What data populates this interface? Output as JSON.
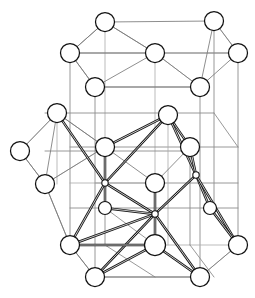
{
  "figure": {
    "width": 255,
    "height": 298,
    "background_color": "#ffffff"
  },
  "colors": {
    "cell_edge": "#8d8d8d",
    "cell_edge_faint": "#a9a9a9",
    "bond_thin": "#7a7a7a",
    "bond_strong": "#141414",
    "atom_fill": "#ffffff",
    "atom_stroke": "#111111"
  },
  "chart_data": {
    "type": "scatter",
    "xlabel": "",
    "ylabel": "",
    "xlim": [
      0,
      255
    ],
    "ylim": [
      0,
      298
    ],
    "grid": false,
    "legend": null,
    "atoms_large": [
      {
        "id": "A1",
        "label": "top-apex-atom",
        "x": 105,
        "y": 22,
        "r": 9.5
      },
      {
        "id": "A2",
        "label": "top-right-atom",
        "x": 214,
        "y": 21,
        "r": 9.5
      },
      {
        "id": "A3",
        "label": "upper-left-atom",
        "x": 70,
        "y": 53,
        "r": 9.5
      },
      {
        "id": "A4",
        "label": "upper-center-atom",
        "x": 155,
        "y": 53,
        "r": 9.5
      },
      {
        "id": "A5",
        "label": "upper-right-edge-atom",
        "x": 238,
        "y": 53,
        "r": 9.5
      },
      {
        "id": "A6",
        "label": "upper-inner-left-atom",
        "x": 95,
        "y": 87,
        "r": 9.5
      },
      {
        "id": "A7",
        "label": "upper-inner-right-atom",
        "x": 200,
        "y": 87,
        "r": 9.5
      },
      {
        "id": "A8",
        "label": "mid-left-corner-atom",
        "x": 57,
        "y": 113,
        "r": 9.5
      },
      {
        "id": "A9",
        "label": "mid-center-top-atom",
        "x": 168,
        "y": 115,
        "r": 9.5
      },
      {
        "id": "A10",
        "label": "far-left-atom",
        "x": 20,
        "y": 151,
        "r": 9.5
      },
      {
        "id": "A11",
        "label": "mid-left-inner-atom",
        "x": 105,
        "y": 147,
        "r": 9.5
      },
      {
        "id": "A12",
        "label": "mid-right-inner-atom",
        "x": 190,
        "y": 147,
        "r": 9.5
      },
      {
        "id": "A13",
        "label": "lower-left-outer-atom",
        "x": 45,
        "y": 184,
        "r": 9.5
      },
      {
        "id": "A14",
        "label": "center-atom",
        "x": 155,
        "y": 183,
        "r": 9.5
      },
      {
        "id": "A15",
        "label": "bottom-left-corner-atom",
        "x": 70,
        "y": 245,
        "r": 9.5
      },
      {
        "id": "A16",
        "label": "bottom-center-atom",
        "x": 155,
        "y": 245,
        "r": 10.5
      },
      {
        "id": "A17",
        "label": "bottom-right-corner-atom",
        "x": 238,
        "y": 245,
        "r": 9.5
      },
      {
        "id": "A18",
        "label": "bottom-front-left-atom",
        "x": 95,
        "y": 277,
        "r": 9.5
      },
      {
        "id": "A19",
        "label": "bottom-front-right-atom",
        "x": 200,
        "y": 277,
        "r": 9.5
      }
    ],
    "atoms_small": [
      {
        "id": "S1",
        "label": "small-atom-left-lower",
        "x": 105,
        "y": 208,
        "r": 6.5
      },
      {
        "id": "S2",
        "label": "small-atom-right-lower",
        "x": 210,
        "y": 208,
        "r": 6.5
      }
    ],
    "nodes_center": [
      {
        "id": "N1",
        "label": "tetrahedral-center-left",
        "x": 105,
        "y": 183,
        "r": 3.2
      },
      {
        "id": "N2",
        "label": "tetrahedral-center-right",
        "x": 196,
        "y": 175,
        "r": 3.2
      },
      {
        "id": "N3",
        "label": "tetrahedral-center-bottom",
        "x": 155,
        "y": 214,
        "r": 3.2
      }
    ],
    "strong_bonds": [
      {
        "from": "A8",
        "to": "N1"
      },
      {
        "from": "A11",
        "to": "N1"
      },
      {
        "from": "N1",
        "to": "S1"
      },
      {
        "from": "N1",
        "to": "A15"
      },
      {
        "from": "N1",
        "to": "N3"
      },
      {
        "from": "A9",
        "to": "N1"
      },
      {
        "from": "A9",
        "to": "A11"
      },
      {
        "from": "A9",
        "to": "A12"
      },
      {
        "from": "A9",
        "to": "N2"
      },
      {
        "from": "A12",
        "to": "N2"
      },
      {
        "from": "N2",
        "to": "S2"
      },
      {
        "from": "N2",
        "to": "A17"
      },
      {
        "from": "N2",
        "to": "N3"
      },
      {
        "from": "S1",
        "to": "N3"
      },
      {
        "from": "A14",
        "to": "N3"
      },
      {
        "from": "N3",
        "to": "A16"
      },
      {
        "from": "N3",
        "to": "A15"
      },
      {
        "from": "N3",
        "to": "A18"
      },
      {
        "from": "N3",
        "to": "A19"
      },
      {
        "from": "A16",
        "to": "A18"
      },
      {
        "from": "A16",
        "to": "A19"
      },
      {
        "from": "A15",
        "to": "A16"
      },
      {
        "from": "S2",
        "to": "A17"
      }
    ],
    "thin_bonds": [
      {
        "from": "A1",
        "to": "A3"
      },
      {
        "from": "A1",
        "to": "A4"
      },
      {
        "from": "A1",
        "to": "A2"
      },
      {
        "from": "A3",
        "to": "A6"
      },
      {
        "from": "A3",
        "to": "A4"
      },
      {
        "from": "A4",
        "to": "A6"
      },
      {
        "from": "A4",
        "to": "A7"
      },
      {
        "from": "A4",
        "to": "A5"
      },
      {
        "from": "A2",
        "to": "A5"
      },
      {
        "from": "A2",
        "to": "A7"
      },
      {
        "from": "A5",
        "to": "A7"
      },
      {
        "from": "A6",
        "to": "A7"
      },
      {
        "from": "A8",
        "to": "A10"
      },
      {
        "from": "A8",
        "to": "A13"
      },
      {
        "from": "A10",
        "to": "A13"
      },
      {
        "from": "A8",
        "to": "A11"
      },
      {
        "from": "A13",
        "to": "A11"
      },
      {
        "from": "A11",
        "to": "A14"
      },
      {
        "from": "A14",
        "to": "A12"
      },
      {
        "from": "A15",
        "to": "A18"
      },
      {
        "from": "A18",
        "to": "A19"
      },
      {
        "from": "A19",
        "to": "A17"
      },
      {
        "from": "A13",
        "to": "A15"
      },
      {
        "from": "A14",
        "to": "A16"
      }
    ],
    "cell_edges": [
      {
        "from": [
          70,
          53
        ],
        "to": [
          70,
          245
        ]
      },
      {
        "from": [
          95,
          87
        ],
        "to": [
          95,
          277
        ]
      },
      {
        "from": [
          155,
          53
        ],
        "to": [
          155,
          245
        ]
      },
      {
        "from": [
          200,
          87
        ],
        "to": [
          200,
          277
        ]
      },
      {
        "from": [
          238,
          53
        ],
        "to": [
          238,
          245
        ]
      },
      {
        "from": [
          105,
          22
        ],
        "to": [
          105,
          208
        ]
      },
      {
        "from": [
          214,
          21
        ],
        "to": [
          214,
          208
        ]
      },
      {
        "from": [
          70,
          53
        ],
        "to": [
          155,
          53
        ]
      },
      {
        "from": [
          155,
          53
        ],
        "to": [
          238,
          53
        ]
      },
      {
        "from": [
          95,
          87
        ],
        "to": [
          200,
          87
        ]
      },
      {
        "from": [
          70,
          245
        ],
        "to": [
          155,
          245
        ]
      },
      {
        "from": [
          155,
          245
        ],
        "to": [
          238,
          245
        ]
      },
      {
        "from": [
          95,
          277
        ],
        "to": [
          200,
          277
        ]
      },
      {
        "from": [
          70,
          53
        ],
        "to": [
          95,
          87
        ]
      },
      {
        "from": [
          155,
          53
        ],
        "to": [
          200,
          87
        ]
      },
      {
        "from": [
          105,
          22
        ],
        "to": [
          70,
          53
        ]
      },
      {
        "from": [
          105,
          22
        ],
        "to": [
          155,
          53
        ]
      },
      {
        "from": [
          214,
          21
        ],
        "to": [
          238,
          53
        ]
      },
      {
        "from": [
          70,
          245
        ],
        "to": [
          95,
          277
        ]
      },
      {
        "from": [
          155,
          245
        ],
        "to": [
          200,
          277
        ]
      },
      {
        "from": [
          238,
          245
        ],
        "to": [
          200,
          277
        ]
      },
      {
        "from": [
          70,
          147
        ],
        "to": [
          238,
          147
        ]
      },
      {
        "from": [
          95,
          183
        ],
        "to": [
          238,
          183
        ]
      },
      {
        "from": [
          70,
          183
        ],
        "to": [
          155,
          183
        ]
      },
      {
        "from": [
          45,
          113
        ],
        "to": [
          214,
          113
        ]
      },
      {
        "from": [
          45,
          151
        ],
        "to": [
          190,
          151
        ]
      },
      {
        "from": [
          57,
          113
        ],
        "to": [
          57,
          184
        ]
      },
      {
        "from": [
          105,
          147
        ],
        "to": [
          105,
          245
        ]
      },
      {
        "from": [
          190,
          147
        ],
        "to": [
          190,
          245
        ]
      },
      {
        "from": [
          168,
          115
        ],
        "to": [
          168,
          245
        ]
      },
      {
        "from": [
          70,
          208
        ],
        "to": [
          238,
          208
        ]
      },
      {
        "from": [
          45,
          184
        ],
        "to": [
          70,
          245
        ]
      },
      {
        "from": [
          57,
          113
        ],
        "to": [
          20,
          151
        ]
      },
      {
        "from": [
          20,
          151
        ],
        "to": [
          45,
          184
        ]
      },
      {
        "from": [
          57,
          113
        ],
        "to": [
          105,
          147
        ]
      },
      {
        "from": [
          45,
          184
        ],
        "to": [
          105,
          147
        ]
      },
      {
        "from": [
          214,
          113
        ],
        "to": [
          238,
          147
        ]
      },
      {
        "from": [
          105,
          208
        ],
        "to": [
          155,
          245
        ]
      },
      {
        "from": [
          210,
          208
        ],
        "to": [
          238,
          245
        ]
      },
      {
        "from": [
          105,
          245
        ],
        "to": [
          155,
          277
        ]
      },
      {
        "from": [
          190,
          245
        ],
        "to": [
          214,
          277
        ]
      }
    ]
  }
}
